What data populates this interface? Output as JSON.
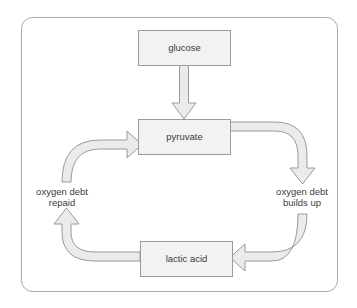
{
  "diagram": {
    "frame": {
      "border_color": "#a9a9a9",
      "background_color": "#ffffff"
    },
    "style": {
      "box_fill": "#f2f2f2",
      "box_stroke": "#9a9a9a",
      "arrow_fill": "#ebebeb",
      "arrow_stroke": "#9a9a9a",
      "text_color": "#3b3b3b"
    },
    "nodes": [
      {
        "id": "glucose",
        "label": "glucose"
      },
      {
        "id": "pyruvate",
        "label": "pyruvate"
      },
      {
        "id": "lactic_acid",
        "label": "lactic acid"
      }
    ],
    "edge_labels": [
      {
        "id": "oxygen_debt_repaid",
        "line1": "oxygen debt",
        "line2": "repaid"
      },
      {
        "id": "oxygen_debt_builds_up",
        "line1": "oxygen debt",
        "line2": "builds up"
      }
    ],
    "arrows": [
      {
        "id": "glucose-to-pyruvate",
        "from": "glucose",
        "to": "pyruvate",
        "direction": "down"
      },
      {
        "id": "pyruvate-to-lactic-acid",
        "from": "pyruvate",
        "to": "lactic_acid",
        "direction": "right-down-left"
      },
      {
        "id": "lactic-acid-to-pyruvate",
        "from": "lactic_acid",
        "to": "pyruvate",
        "direction": "left-up-right"
      }
    ]
  }
}
